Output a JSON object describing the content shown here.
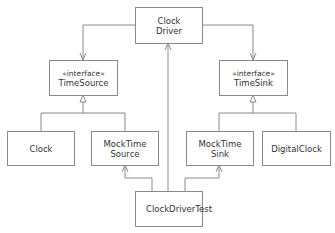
{
  "diagram": {
    "type": "UML class diagram",
    "colors": {
      "line": "#8a8a8a",
      "text": "#333333",
      "background": "#ffffff"
    },
    "nodes": [
      {
        "id": "clock_driver",
        "lines": [
          "Clock",
          "Driver"
        ]
      },
      {
        "id": "time_source",
        "stereotype": "«interface»",
        "lines": [
          "TimeSource"
        ]
      },
      {
        "id": "time_sink",
        "stereotype": "«interface»",
        "lines": [
          "TimeSink"
        ]
      },
      {
        "id": "clock",
        "lines": [
          "Clock"
        ]
      },
      {
        "id": "mock_time_source",
        "lines": [
          "MockTime",
          "Source"
        ]
      },
      {
        "id": "mock_time_sink",
        "lines": [
          "MockTime",
          "Sink"
        ]
      },
      {
        "id": "digital_clock",
        "lines": [
          "DigitalClock"
        ]
      },
      {
        "id": "clock_driver_test",
        "lines": [
          "ClockDriverTest"
        ]
      }
    ],
    "edges": [
      {
        "from": "clock_driver",
        "to": "time_source",
        "kind": "association (open arrow)"
      },
      {
        "from": "clock_driver",
        "to": "time_sink",
        "kind": "association (open arrow)"
      },
      {
        "from": "clock",
        "to": "time_source",
        "kind": "realization (hollow triangle)"
      },
      {
        "from": "mock_time_source",
        "to": "time_source",
        "kind": "realization (hollow triangle)"
      },
      {
        "from": "mock_time_sink",
        "to": "time_sink",
        "kind": "realization (hollow triangle)"
      },
      {
        "from": "digital_clock",
        "to": "time_sink",
        "kind": "realization (hollow triangle)"
      },
      {
        "from": "clock_driver_test",
        "to": "clock_driver",
        "kind": "association (open arrow)"
      },
      {
        "from": "clock_driver_test",
        "to": "mock_time_source",
        "kind": "association (open arrow)"
      },
      {
        "from": "clock_driver_test",
        "to": "mock_time_sink",
        "kind": "association (open arrow)"
      }
    ]
  }
}
